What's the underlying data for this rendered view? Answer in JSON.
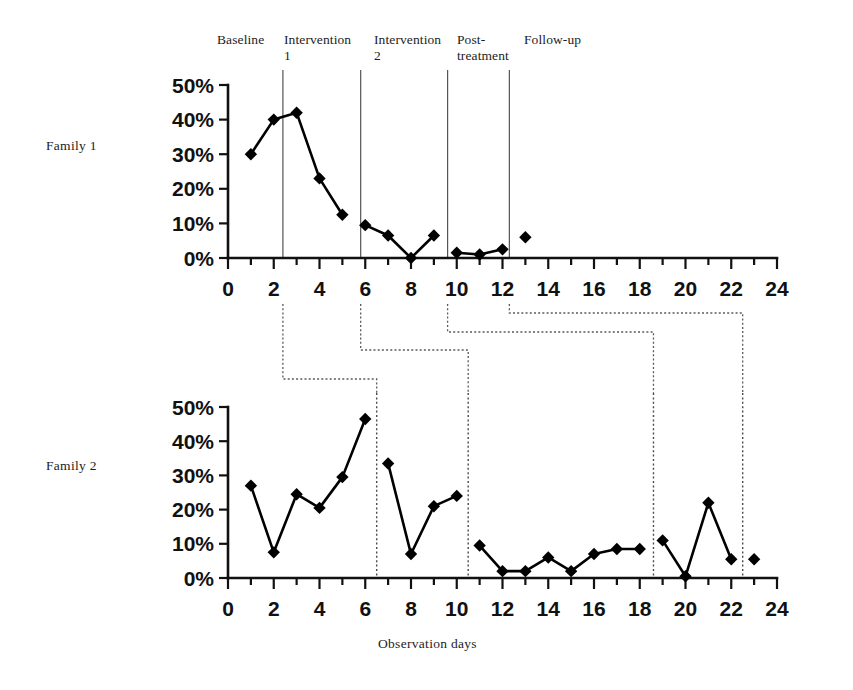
{
  "figure": {
    "family1_label": "Family 1",
    "family2_label": "Family 2",
    "xaxis_title": "Observation days"
  },
  "phases": [
    {
      "name": "baseline",
      "label": "Baseline"
    },
    {
      "name": "intervention-1",
      "label": "Intervention\n1"
    },
    {
      "name": "intervention-2",
      "label": "Intervention\n2"
    },
    {
      "name": "post-treatment",
      "label": "Post-\ntreatment"
    },
    {
      "name": "follow-up",
      "label": "Follow-up"
    }
  ],
  "chart_data": [
    {
      "type": "line",
      "title": "Family 1",
      "xlabel": "Observation days",
      "ylabel": "",
      "xlim": [
        0,
        24
      ],
      "ylim": [
        0,
        50
      ],
      "grid": false,
      "legend": "none",
      "xticks": [
        0,
        2,
        4,
        6,
        8,
        10,
        12,
        14,
        16,
        18,
        20,
        22,
        24
      ],
      "xtick_labels": [
        "0",
        "2",
        "4",
        "6",
        "8",
        "10",
        "12",
        "14",
        "16",
        "18",
        "20",
        "22",
        "24"
      ],
      "yticks": [
        0,
        10,
        20,
        30,
        40,
        50
      ],
      "ytick_labels": [
        "0%",
        "10%",
        "20%",
        "30%",
        "40%",
        "50%"
      ],
      "x": [
        1,
        2,
        3,
        4,
        5,
        6,
        7,
        8,
        9,
        10,
        11,
        12,
        13
      ],
      "values": [
        30,
        40,
        42,
        23,
        12.5,
        9.5,
        6.5,
        0,
        6.5,
        1.5,
        1,
        2.5,
        6
      ],
      "segments": [
        [
          1,
          2,
          3,
          4,
          5
        ],
        [
          6,
          7,
          8,
          9
        ],
        [
          10,
          11,
          12
        ],
        [
          13
        ]
      ],
      "phase_boundaries": [
        2.4,
        5.8,
        9.6,
        12.3
      ],
      "phase_labels": [
        "Baseline",
        "Intervention 1",
        "Intervention 2",
        "Post-treatment",
        "Follow-up"
      ]
    },
    {
      "type": "line",
      "title": "Family 2",
      "xlabel": "Observation days",
      "ylabel": "",
      "xlim": [
        0,
        24
      ],
      "ylim": [
        0,
        50
      ],
      "grid": false,
      "legend": "none",
      "xticks": [
        0,
        2,
        4,
        6,
        8,
        10,
        12,
        14,
        16,
        18,
        20,
        22,
        24
      ],
      "xtick_labels": [
        "0",
        "2",
        "4",
        "6",
        "8",
        "10",
        "12",
        "14",
        "16",
        "18",
        "20",
        "22",
        "24"
      ],
      "yticks": [
        0,
        10,
        20,
        30,
        40,
        50
      ],
      "ytick_labels": [
        "0%",
        "10%",
        "20%",
        "30%",
        "40%",
        "50%"
      ],
      "x": [
        1,
        2,
        3,
        4,
        5,
        6,
        7,
        8,
        9,
        10,
        11,
        12,
        13,
        14,
        15,
        16,
        17,
        18,
        19,
        20,
        21,
        22,
        23
      ],
      "values": [
        27,
        7.5,
        24.5,
        20.5,
        29.5,
        46.5,
        33.5,
        7,
        21,
        24,
        9.5,
        2,
        2,
        6,
        2,
        7,
        8.5,
        8.5,
        11,
        0.5,
        22,
        5.5,
        5.5
      ],
      "segments": [
        [
          1,
          2,
          3,
          4,
          5,
          6
        ],
        [
          7,
          8,
          9,
          10
        ],
        [
          11,
          12,
          13,
          14,
          15,
          16,
          17,
          18
        ],
        [
          19,
          20,
          21,
          22
        ],
        [
          23
        ]
      ],
      "phase_boundaries": [
        6.5,
        10.5,
        18.6,
        22.5
      ],
      "phase_labels": [
        "Baseline",
        "Intervention 1",
        "Intervention 2",
        "Post-treatment",
        "Follow-up"
      ]
    }
  ]
}
